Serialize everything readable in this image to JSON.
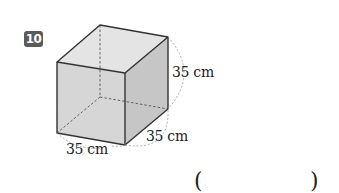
{
  "problem": {
    "number": "10",
    "figure": {
      "shape": "cube",
      "dimensions": {
        "height": "35 cm",
        "depth": "35 cm",
        "width": "35 cm"
      }
    },
    "answer_blank": {
      "open": "(",
      "close": ")",
      "value": ""
    }
  },
  "colors": {
    "badge": "#5a5a5a",
    "face_front": "#d8d8d8",
    "face_top": "#e4e4e4",
    "face_side": "#c4c4c4",
    "edge": "#333333"
  }
}
